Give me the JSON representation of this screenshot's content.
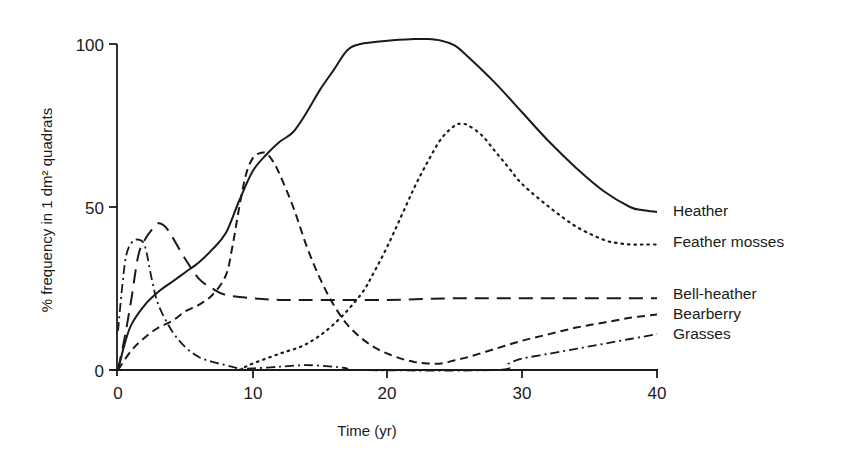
{
  "chart_data": {
    "type": "line",
    "title": "",
    "xlabel": "Time (yr)",
    "ylabel": "% frequency in 1 dm² quadrats",
    "xlim": [
      0,
      40
    ],
    "ylim": [
      0,
      100
    ],
    "xticks": [
      "0",
      "10",
      "20",
      "30",
      "40"
    ],
    "yticks": [
      "0",
      "50",
      "100"
    ],
    "grid": false,
    "legend_position": "right, inline labels at line ends",
    "series": [
      {
        "name": "Heather",
        "style": "solid",
        "x": [
          0,
          0.5,
          1,
          2,
          3,
          4,
          5,
          6,
          7,
          8,
          9,
          10,
          11,
          12,
          13,
          14,
          15,
          16,
          17,
          18,
          20,
          22,
          23,
          24,
          25,
          26,
          28,
          30,
          32,
          34,
          36,
          38,
          39,
          40
        ],
        "y": [
          0,
          8,
          14,
          20,
          24,
          27,
          30,
          33,
          37,
          42,
          52,
          61,
          66,
          70,
          73,
          79,
          86,
          92,
          98,
          100,
          101,
          101.5,
          101.5,
          101,
          99.5,
          96,
          88,
          79,
          70,
          62,
          55,
          50,
          49,
          48.5
        ]
      },
      {
        "name": "Feather mosses",
        "style": "dotted",
        "x": [
          9,
          10,
          12,
          14,
          16,
          18,
          19,
          20,
          21,
          22,
          23,
          24,
          25,
          25.5,
          26,
          27,
          28,
          29,
          30,
          32,
          34,
          36,
          37,
          38,
          39,
          40
        ],
        "y": [
          0,
          2,
          5,
          8,
          14,
          23,
          30,
          38,
          47,
          56,
          64,
          71,
          75,
          75.5,
          75,
          72,
          67,
          62,
          57,
          50,
          44,
          40,
          39,
          38.5,
          38.5,
          38.5
        ]
      },
      {
        "name": "Bell-heather",
        "style": "long-dash",
        "x": [
          0,
          0.5,
          1,
          1.5,
          2,
          2.5,
          3,
          3.5,
          4,
          5,
          6,
          7,
          8,
          10,
          12,
          15,
          20,
          25,
          30,
          35,
          40
        ],
        "y": [
          0,
          10,
          22,
          35,
          40,
          43,
          45,
          44,
          41,
          34,
          28,
          25,
          23,
          22,
          21.5,
          21.5,
          21.5,
          22,
          22,
          22,
          22
        ]
      },
      {
        "name": "Bearberry",
        "style": "short-dash",
        "x": [
          0,
          1,
          2,
          3,
          4,
          5,
          6,
          7,
          8,
          8.5,
          9,
          9.5,
          10,
          10.5,
          11,
          11.5,
          12,
          13,
          14,
          15,
          16,
          17,
          18,
          19,
          20,
          21,
          22,
          23,
          24,
          25,
          26,
          28,
          30,
          32,
          34,
          36,
          38,
          40
        ],
        "y": [
          0,
          6,
          10,
          13,
          15,
          18,
          20,
          23,
          29,
          38,
          50,
          60,
          65,
          66.5,
          66.5,
          64,
          60,
          50,
          38,
          28,
          20,
          14,
          10,
          7,
          5,
          3.5,
          2.5,
          2,
          2,
          3,
          4,
          6.5,
          9,
          11,
          13,
          14.5,
          16,
          17
        ]
      },
      {
        "name": "Grasses",
        "style": "dash-dot",
        "x": [
          0,
          0.3,
          0.6,
          1,
          1.5,
          2,
          2.5,
          3,
          4,
          5,
          6,
          7,
          8,
          9,
          10,
          12,
          14,
          16,
          17,
          17.5,
          28,
          29,
          30,
          32,
          34,
          36,
          38,
          40
        ],
        "y": [
          12,
          25,
          35,
          39,
          40,
          38,
          28,
          20,
          12,
          7,
          4,
          2.5,
          1.5,
          0.5,
          0.5,
          1,
          1.5,
          1,
          0.5,
          0,
          0,
          2,
          3.5,
          5,
          6.5,
          8,
          9.5,
          11
        ]
      }
    ]
  }
}
